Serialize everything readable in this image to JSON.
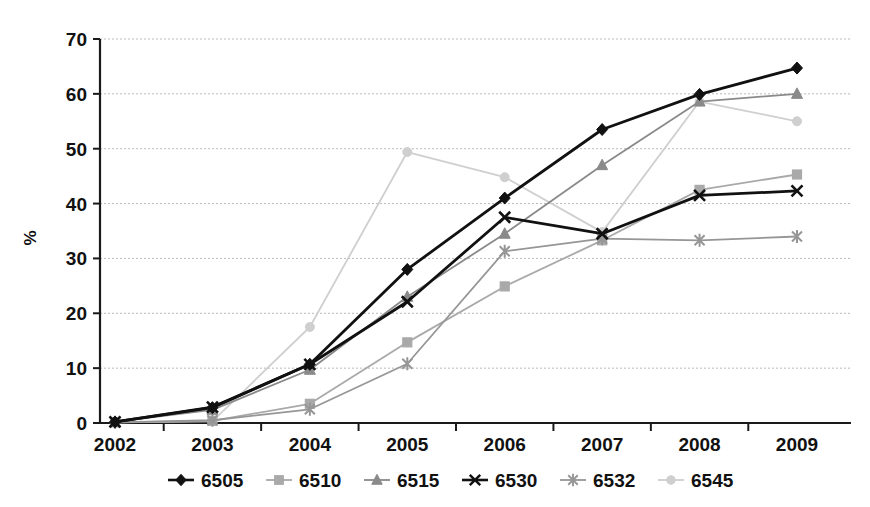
{
  "chart_data": {
    "type": "line",
    "title": "",
    "xlabel": "",
    "ylabel": "%",
    "categories": [
      "2002",
      "2003",
      "2004",
      "2005",
      "2006",
      "2007",
      "2008",
      "2009"
    ],
    "ylim": [
      0,
      70
    ],
    "yticks": [
      0,
      10,
      20,
      30,
      40,
      50,
      60,
      70
    ],
    "ytick_labels": [
      "0",
      "10",
      "20",
      "30",
      "40",
      "50",
      "60",
      "70"
    ],
    "grid": true,
    "legend_position": "bottom",
    "series": [
      {
        "name": "6505",
        "color": "#111111",
        "marker": "diamond",
        "values": [
          0.2,
          2.8,
          10.7,
          28.0,
          41.0,
          53.5,
          59.9,
          64.7
        ]
      },
      {
        "name": "6510",
        "color": "#a9a9a9",
        "marker": "square",
        "values": [
          0.1,
          0.4,
          3.5,
          14.7,
          24.9,
          33.3,
          42.5,
          45.3
        ]
      },
      {
        "name": "6515",
        "color": "#8a8a8a",
        "marker": "triangle",
        "values": [
          0.2,
          2.4,
          9.7,
          23.0,
          34.5,
          47.0,
          58.6,
          60.0
        ]
      },
      {
        "name": "6530",
        "color": "#111111",
        "marker": "cross",
        "values": [
          0.2,
          2.9,
          10.7,
          22.1,
          37.5,
          34.5,
          41.5,
          42.3
        ]
      },
      {
        "name": "6532",
        "color": "#969696",
        "marker": "asterisk",
        "values": [
          0.1,
          0.5,
          2.5,
          10.8,
          31.3,
          33.6,
          33.3,
          34.0
        ]
      },
      {
        "name": "6545",
        "color": "#cfcfcf",
        "marker": "circle",
        "values": [
          0.1,
          0.3,
          17.5,
          49.4,
          44.8,
          34.8,
          58.6,
          55.0
        ]
      }
    ]
  },
  "legend": {
    "entries": [
      {
        "label": "6505"
      },
      {
        "label": "6510"
      },
      {
        "label": "6515"
      },
      {
        "label": "6530"
      },
      {
        "label": "6532"
      },
      {
        "label": "6545"
      }
    ]
  }
}
